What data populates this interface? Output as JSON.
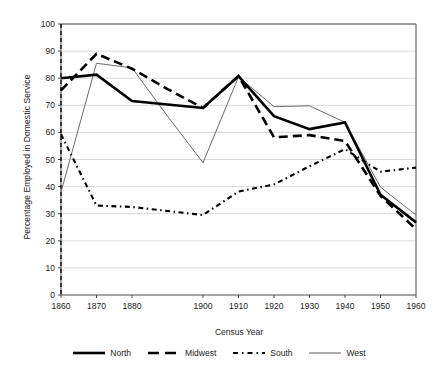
{
  "chart_data": {
    "type": "line",
    "title": "",
    "xlabel": "Census Year",
    "ylabel": "Percentage Employed in Domestic Service",
    "xlim": [
      1860,
      1960
    ],
    "ylim": [
      0,
      100
    ],
    "ytick_labels": [
      "100",
      "90",
      "80",
      "70",
      "60",
      "50",
      "40",
      "30",
      "20",
      "10",
      "0"
    ],
    "ytick_values": [
      100,
      90,
      80,
      70,
      60,
      50,
      40,
      30,
      20,
      10,
      0
    ],
    "xtick_labels": [
      "1860",
      "1870",
      "1880",
      "1900",
      "1910",
      "1920",
      "1930",
      "1940",
      "1950",
      "1960"
    ],
    "xtick_values": [
      1860,
      1870,
      1880,
      1900,
      1910,
      1920,
      1930,
      1940,
      1950,
      1960
    ],
    "grid": "horizontal",
    "legend_position": "bottom",
    "x": [
      1860,
      1870,
      1880,
      1890,
      1900,
      1910,
      1920,
      1930,
      1940,
      1950,
      1960
    ],
    "series": [
      {
        "name": "North",
        "style": "solid-thick",
        "color": "#000000",
        "values": [
          80.0,
          81.3,
          71.6,
          70.3,
          69.0,
          80.8,
          66.0,
          61.2,
          63.7,
          37.0,
          26.8
        ]
      },
      {
        "name": "Midwest",
        "style": "dashed-thick",
        "color": "#000000",
        "values": [
          75.5,
          89.0,
          83.5,
          76.0,
          69.0,
          80.8,
          58.2,
          59.0,
          56.8,
          36.6,
          24.3
        ]
      },
      {
        "name": "South",
        "style": "dotted",
        "color": "#000000",
        "values": [
          59.3,
          33.0,
          32.5,
          31.0,
          29.5,
          38.2,
          40.8,
          47.5,
          53.8,
          45.5,
          47.0
        ]
      },
      {
        "name": "West",
        "style": "solid-thin",
        "color": "#6b6b6b",
        "values": [
          38.0,
          85.5,
          83.8,
          66.0,
          48.8,
          80.5,
          69.5,
          69.8,
          63.7,
          39.8,
          29.5
        ]
      }
    ],
    "annotations": [
      {
        "name": "reference-line",
        "type": "vertical-dashed",
        "x": 1860
      }
    ]
  },
  "legend": {
    "items": [
      {
        "label": "North"
      },
      {
        "label": "Midwest"
      },
      {
        "label": "South"
      },
      {
        "label": "West"
      }
    ]
  }
}
